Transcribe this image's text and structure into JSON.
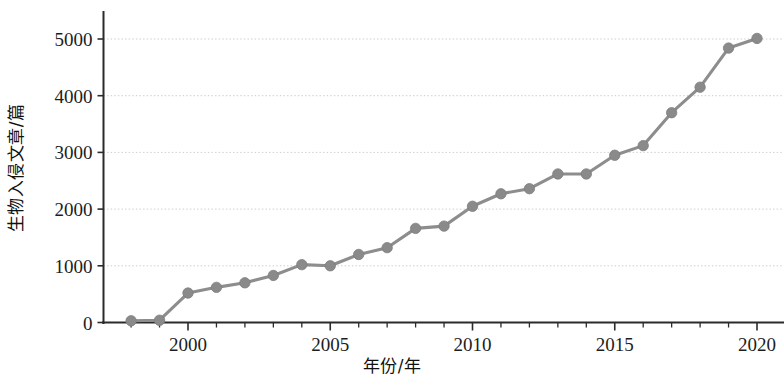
{
  "chart_data": {
    "type": "line",
    "title": "",
    "subtitle": "",
    "xlabel": "年份/年",
    "ylabel": "生物入侵文章/篇",
    "xlim": [
      1997.2,
      2020.6
    ],
    "ylim": [
      0,
      5400
    ],
    "xticks": [
      2000,
      2005,
      2010,
      2015,
      2020
    ],
    "xtick_labels": [
      "2000",
      "2005",
      "2010",
      "2015",
      "2020"
    ],
    "yticks": [
      0,
      1000,
      2000,
      3000,
      4000,
      5000
    ],
    "ytick_labels": [
      "0",
      "1000",
      "2000",
      "3000",
      "4000",
      "5000"
    ],
    "grid": "horizontal-dotted",
    "legend": "none",
    "marker": "circle",
    "line_color": "#8d8d8d",
    "marker_color": "#8a8a8a",
    "x": [
      1998,
      1999,
      2000,
      2001,
      2002,
      2003,
      2004,
      2005,
      2006,
      2007,
      2008,
      2009,
      2010,
      2011,
      2012,
      2013,
      2014,
      2015,
      2016,
      2017,
      2018,
      2019,
      2020
    ],
    "values": [
      30,
      40,
      520,
      620,
      700,
      830,
      1020,
      1000,
      1200,
      1320,
      1660,
      1700,
      2050,
      2270,
      2360,
      2620,
      2620,
      2950,
      3120,
      3700,
      4150,
      4840,
      5010
    ],
    "series": [
      {
        "name": "生物入侵文章/篇",
        "values": [
          30,
          40,
          520,
          620,
          700,
          830,
          1020,
          1000,
          1200,
          1320,
          1660,
          1700,
          2050,
          2270,
          2360,
          2620,
          2620,
          2950,
          3120,
          3700,
          4150,
          4840,
          5010
        ]
      }
    ]
  },
  "axes": {
    "x_axis_label": "年份/年",
    "y_axis_label": "生物入侵文章/篇"
  }
}
